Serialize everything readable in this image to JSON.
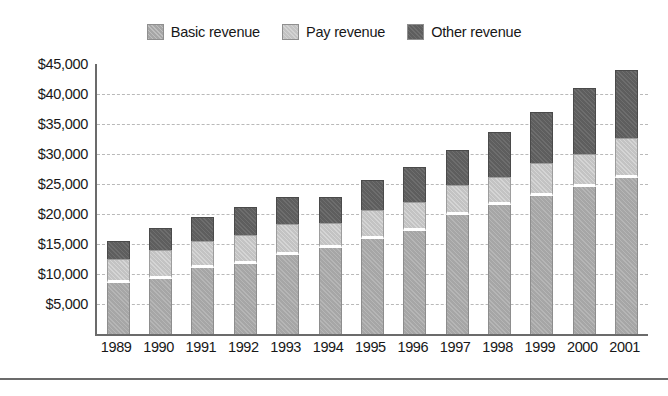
{
  "chart_data": {
    "type": "bar",
    "stacked": true,
    "title": "",
    "subtitle": "",
    "xlabel": "",
    "ylabel": "",
    "categories": [
      "1989",
      "1990",
      "1991",
      "1992",
      "1993",
      "1994",
      "1995",
      "1996",
      "1997",
      "1998",
      "1999",
      "2000",
      "2001"
    ],
    "series": [
      {
        "name": "Basic revenue",
        "color": "#a6a6a6",
        "values": [
          8500,
          9200,
          11000,
          11700,
          13200,
          14300,
          15800,
          17200,
          19800,
          21500,
          23000,
          24500,
          26000
        ]
      },
      {
        "name": "Pay revenue",
        "color": "#c3c3c3",
        "values": [
          4000,
          4800,
          4500,
          4800,
          5200,
          4200,
          4800,
          4800,
          5000,
          4600,
          5500,
          5500,
          6700
        ]
      },
      {
        "name": "Other revenue",
        "color": "#5e5e5e",
        "values": [
          3000,
          3700,
          4000,
          4600,
          4500,
          4400,
          5100,
          5800,
          5800,
          7600,
          8500,
          11000,
          11300
        ]
      }
    ],
    "totals": [
      15500,
      17700,
      19500,
      21100,
      22900,
      22900,
      25700,
      27800,
      30600,
      33700,
      37000,
      41000,
      44000
    ],
    "ylim": [
      0,
      45000
    ],
    "y_tick_step": 5000,
    "y_ticks": [
      45000,
      40000,
      35000,
      30000,
      25000,
      20000,
      15000,
      10000,
      5000
    ],
    "y_tick_labels": [
      "$45,000",
      "$40,000",
      "$35,000",
      "$30,000",
      "$25,000",
      "$20,000",
      "$15,000",
      "$10,000",
      "$5,000"
    ],
    "grid": true,
    "grid_style": "dashed",
    "grid_color": "#b9b9b9",
    "legend_position": "top-center"
  },
  "legend": {
    "items": [
      {
        "label": "Basic revenue",
        "color": "#a6a6a6",
        "swatch_name": "legend-swatch-basic-revenue"
      },
      {
        "label": "Pay revenue",
        "color": "#c3c3c3",
        "swatch_name": "legend-swatch-pay-revenue"
      },
      {
        "label": "Other revenue",
        "color": "#5e5e5e",
        "swatch_name": "legend-swatch-other-revenue"
      }
    ]
  },
  "axis": {
    "line_color": "#6b6b6b"
  }
}
